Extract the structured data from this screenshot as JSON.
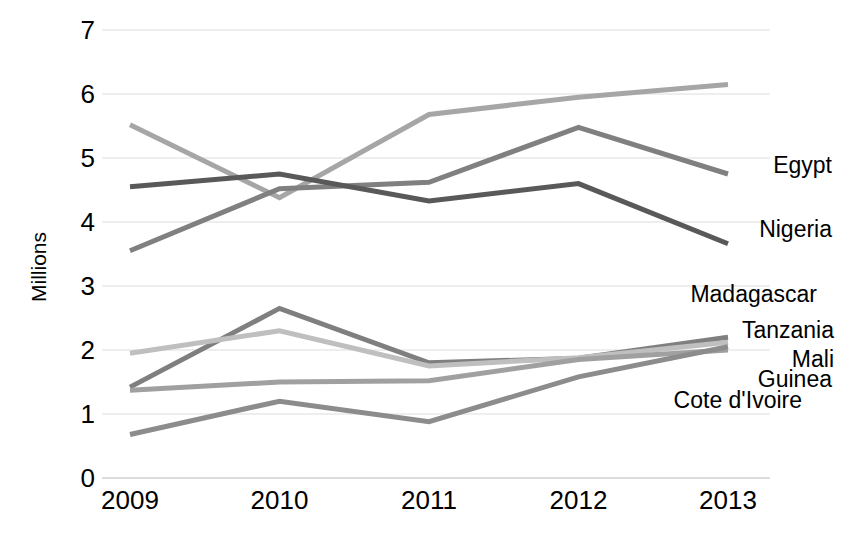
{
  "chart_data": {
    "type": "line",
    "title": "",
    "xlabel": "",
    "ylabel": "Millions",
    "categories": [
      "2009",
      "2010",
      "2011",
      "2012",
      "2013"
    ],
    "x": [
      2009,
      2010,
      2011,
      2012,
      2013
    ],
    "ylim": [
      0,
      7
    ],
    "yticks": [
      "0",
      "1",
      "2",
      "3",
      "4",
      "5",
      "6",
      "7"
    ],
    "ytick_values": [
      0,
      1,
      2,
      3,
      4,
      5,
      6,
      7
    ],
    "grid": true,
    "legend_position": "right-inline-labels",
    "series": [
      {
        "name": "Egypt",
        "values": [
          5.52,
          4.38,
          5.68,
          5.95,
          6.15
        ],
        "color": "#a6a6a6",
        "label_y": 4.88
      },
      {
        "name": "Nigeria",
        "values": [
          3.55,
          4.52,
          4.62,
          5.48,
          4.75
        ],
        "color": "#808080",
        "label_y": 3.88
      },
      {
        "name": "Madagascar",
        "values": [
          4.55,
          4.75,
          4.33,
          4.6,
          3.66
        ],
        "color": "#595959",
        "label_y": 2.86
      },
      {
        "name": "Tanzania",
        "values": [
          1.42,
          2.65,
          1.8,
          1.87,
          2.2
        ],
        "color": "#7f7f7f",
        "label_y": 2.3
      },
      {
        "name": "Mali",
        "values": [
          1.95,
          2.3,
          1.75,
          1.88,
          2.12
        ],
        "color": "#bfbfbf",
        "label_y": 1.84
      },
      {
        "name": "Guinea",
        "values": [
          1.37,
          1.5,
          1.52,
          1.85,
          2.0
        ],
        "color": "#a0a0a0",
        "label_y": 1.53
      },
      {
        "name": "Cote d'Ivoire",
        "values": [
          0.68,
          1.2,
          0.88,
          1.58,
          2.05
        ],
        "color": "#8c8c8c",
        "label_y": 1.2
      }
    ],
    "grid_color": "#e8e8e8",
    "text_color": "#000000"
  }
}
